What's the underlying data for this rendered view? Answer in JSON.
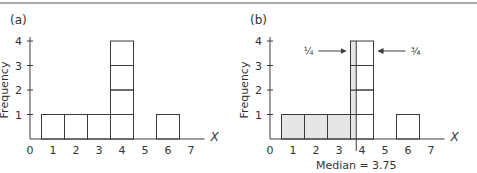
{
  "chart_data": [
    {
      "panel_label": "(a)",
      "type": "bar",
      "style": "stacked unit boxes (histogram)",
      "xlabel": "X",
      "ylabel": "Frequency",
      "x_ticks": [
        "0",
        "1",
        "2",
        "3",
        "4",
        "5",
        "6",
        "7"
      ],
      "y_ticks": [
        "1",
        "2",
        "3",
        "4"
      ],
      "categories": [
        1,
        2,
        3,
        4,
        5,
        6,
        7
      ],
      "values": [
        1,
        1,
        1,
        4,
        0,
        1,
        0
      ],
      "ylim": [
        0,
        4
      ],
      "xlim": [
        0,
        7.5
      ],
      "grid": false,
      "shaded": false
    },
    {
      "panel_label": "(b)",
      "type": "bar",
      "style": "stacked unit boxes (histogram), area left of median shaded",
      "xlabel": "X",
      "ylabel": "Frequency",
      "x_ticks": [
        "0",
        "1",
        "2",
        "3",
        "4",
        "5",
        "6",
        "7"
      ],
      "y_ticks": [
        "1",
        "2",
        "3",
        "4"
      ],
      "categories": [
        1,
        2,
        3,
        4,
        5,
        6,
        7
      ],
      "values": [
        1,
        1,
        1,
        4,
        0,
        1,
        0
      ],
      "ylim": [
        0,
        4
      ],
      "xlim": [
        0,
        7.5
      ],
      "grid": false,
      "shaded": true,
      "median": 3.75,
      "annotations": [
        {
          "text": "1/4",
          "display": "¼",
          "arrow": "right",
          "points_to": "left quarter of bar at X=4"
        },
        {
          "text": "3/4",
          "display": "¾",
          "arrow": "left",
          "points_to": "right three quarters of bar at X=4"
        }
      ],
      "caption": "Median = 3.75"
    }
  ],
  "labels": {
    "panel_a": "(a)",
    "panel_b": "(b)",
    "ylabel": "Frequency",
    "xlabel": "X",
    "one_quarter": "¼",
    "three_quarters": "¾",
    "median_caption": "Median = 3.75"
  },
  "colors": {
    "shade": "#e6e6e6",
    "line": "#3a3a3a",
    "rule": "#a8a8a8"
  }
}
